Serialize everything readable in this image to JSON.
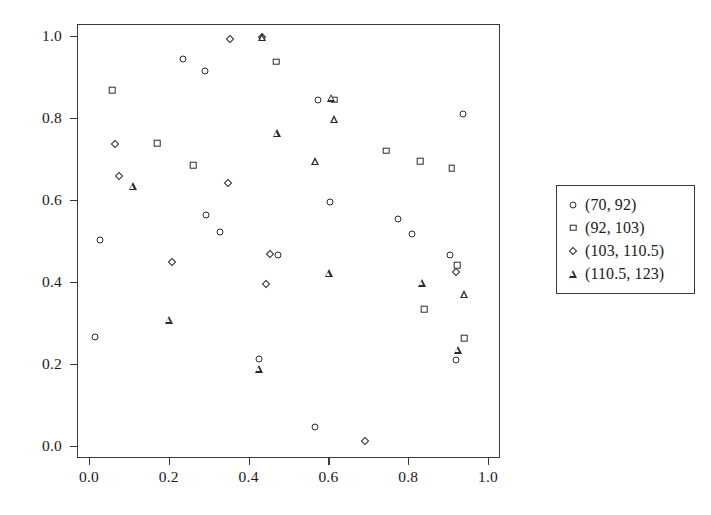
{
  "chart_data": {
    "type": "scatter",
    "title": "",
    "xlabel": "",
    "ylabel": "",
    "xlim": [
      -0.03,
      1.03
    ],
    "ylim": [
      -0.03,
      1.03
    ],
    "grid": false,
    "legend_position": "right",
    "xticks": [
      "0.0",
      "0.2",
      "0.4",
      "0.6",
      "0.8",
      "1.0"
    ],
    "xtick_values": [
      0.0,
      0.2,
      0.4,
      0.6,
      0.8,
      1.0
    ],
    "yticks": [
      "0.0",
      "0.2",
      "0.4",
      "0.6",
      "0.8",
      "1.0"
    ],
    "ytick_values": [
      0.0,
      0.2,
      0.4,
      0.6,
      0.8,
      1.0
    ],
    "series": [
      {
        "name": "(70, 92)",
        "marker": "circle",
        "points": [
          [
            0.012,
            0.268
          ],
          [
            0.026,
            0.505
          ],
          [
            0.232,
            0.947
          ],
          [
            0.288,
            0.918
          ],
          [
            0.292,
            0.565
          ],
          [
            0.327,
            0.525
          ],
          [
            0.423,
            0.215
          ],
          [
            0.472,
            0.468
          ],
          [
            0.565,
            0.048
          ],
          [
            0.572,
            0.848
          ],
          [
            0.602,
            0.597
          ],
          [
            0.772,
            0.557
          ],
          [
            0.806,
            0.52
          ],
          [
            0.902,
            0.468
          ],
          [
            0.918,
            0.213
          ],
          [
            0.936,
            0.812
          ]
        ]
      },
      {
        "name": "(92, 103)",
        "marker": "square",
        "points": [
          [
            0.056,
            0.871
          ],
          [
            0.168,
            0.742
          ],
          [
            0.258,
            0.688
          ],
          [
            0.466,
            0.94
          ],
          [
            0.612,
            0.848
          ],
          [
            0.742,
            0.723
          ],
          [
            0.828,
            0.697
          ],
          [
            0.838,
            0.336
          ],
          [
            0.906,
            0.68
          ],
          [
            0.92,
            0.443
          ],
          [
            0.938,
            0.265
          ]
        ]
      },
      {
        "name": "(103, 110.5)",
        "marker": "diamond",
        "points": [
          [
            0.062,
            0.739
          ],
          [
            0.072,
            0.662
          ],
          [
            0.205,
            0.452
          ],
          [
            0.347,
            0.643
          ],
          [
            0.352,
            0.996
          ],
          [
            0.432,
            1.0
          ],
          [
            0.44,
            0.397
          ],
          [
            0.452,
            0.47
          ],
          [
            0.688,
            0.015
          ],
          [
            0.916,
            0.427
          ]
        ]
      },
      {
        "name": "(110.5, 123)",
        "marker": "triangle",
        "points": [
          [
            0.108,
            0.636
          ],
          [
            0.198,
            0.31
          ],
          [
            0.423,
            0.191
          ],
          [
            0.432,
            1.0
          ],
          [
            0.468,
            0.766
          ],
          [
            0.565,
            0.697
          ],
          [
            0.598,
            0.424
          ],
          [
            0.605,
            0.852
          ],
          [
            0.612,
            0.8
          ],
          [
            0.832,
            0.401
          ],
          [
            0.922,
            0.237
          ],
          [
            0.938,
            0.372
          ]
        ]
      }
    ]
  },
  "legend": {
    "entries": [
      {
        "label": "(70, 92)",
        "marker": "circle"
      },
      {
        "label": "(92, 103)",
        "marker": "square"
      },
      {
        "label": "(103, 110.5)",
        "marker": "diamond"
      },
      {
        "label": "(110.5, 123)",
        "marker": "triangle"
      }
    ]
  },
  "colors": {
    "marker_stroke": "#2b2b2b",
    "axis": "#3a3a3a",
    "background": "#ffffff",
    "text": "#1a1a1a"
  }
}
